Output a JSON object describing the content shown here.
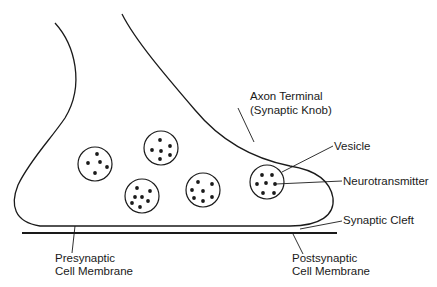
{
  "diagram": {
    "labels": {
      "axon_terminal_line1": "Axon Terminal",
      "axon_terminal_line2": "(Synaptic Knob)",
      "vesicle": "Vesicle",
      "neurotransmitter": "Neurotransmitter",
      "synaptic_cleft": "Synaptic Cleft",
      "presynaptic_line1": "Presynaptic",
      "presynaptic_line2": "Cell Membrane",
      "postsynaptic_line1": "Postsynaptic",
      "postsynaptic_line2": "Cell Membrane"
    },
    "vesicles": [
      {
        "cx": 95,
        "cy": 164,
        "dots": 5
      },
      {
        "cx": 161,
        "cy": 148,
        "dots": 6
      },
      {
        "cx": 142,
        "cy": 196,
        "dots": 7
      },
      {
        "cx": 203,
        "cy": 190,
        "dots": 7
      },
      {
        "cx": 267,
        "cy": 182,
        "dots": 7
      }
    ],
    "colors": {
      "stroke": "#1a1a1a",
      "background": "#ffffff"
    }
  }
}
